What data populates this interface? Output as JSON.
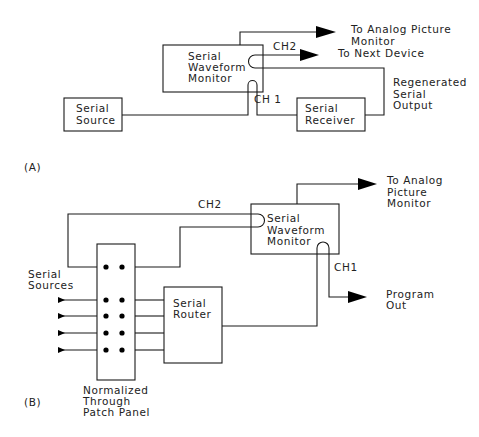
{
  "diagram_a": {
    "label": "(A)",
    "waveform_monitor": [
      "Serial",
      "Waveform",
      "Monitor"
    ],
    "serial_source": [
      "Serial",
      "Source"
    ],
    "serial_receiver": [
      "Serial",
      "Receiver"
    ],
    "ch2_label": "CH2",
    "ch1_label": "CH 1",
    "to_analog_picture_monitor": [
      "To Analog Picture",
      "Monitor"
    ],
    "to_next_device": "To Next Device",
    "regenerated_output": [
      "Regenerated",
      "Serial",
      "Output"
    ]
  },
  "diagram_b": {
    "label": "(B)",
    "waveform_monitor": [
      "Serial",
      "Waveform",
      "Monitor"
    ],
    "serial_sources": [
      "Serial",
      "Sources"
    ],
    "serial_router": [
      "Serial",
      "Router"
    ],
    "patch_panel": [
      "Normalized",
      "Through",
      "Patch Panel"
    ],
    "ch2_label": "CH2",
    "ch1_label": "CH1",
    "to_analog_picture_monitor": [
      "To Analog",
      "Picture",
      "Monitor"
    ],
    "program_out": [
      "Program",
      "Out"
    ]
  }
}
